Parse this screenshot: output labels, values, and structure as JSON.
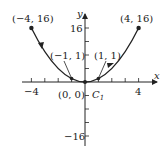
{
  "figure": {
    "curve_label": "C",
    "curve_subscript": "1",
    "x_axis_label": "x",
    "y_axis_label": "y",
    "x_ticks": [
      {
        "value": -4,
        "label": "−4"
      },
      {
        "value": 4,
        "label": "4"
      }
    ],
    "y_ticks": [
      {
        "value": 16,
        "label": "16"
      },
      {
        "value": -16,
        "label": "−16"
      }
    ],
    "points": [
      {
        "label": "(−4, 16)",
        "x": -4,
        "y": 16
      },
      {
        "label": "(−1, 1)",
        "x": -1,
        "y": 1
      },
      {
        "label": "(0, 0)",
        "x": 0,
        "y": 0
      },
      {
        "label": "(1, 1)",
        "x": 1,
        "y": 1
      },
      {
        "label": "(4, 16)",
        "x": 4,
        "y": 16
      }
    ],
    "curve": "y = x^2, x from -4 to 4",
    "colors": {
      "ink": "#222222",
      "background": "#ffffff"
    }
  }
}
